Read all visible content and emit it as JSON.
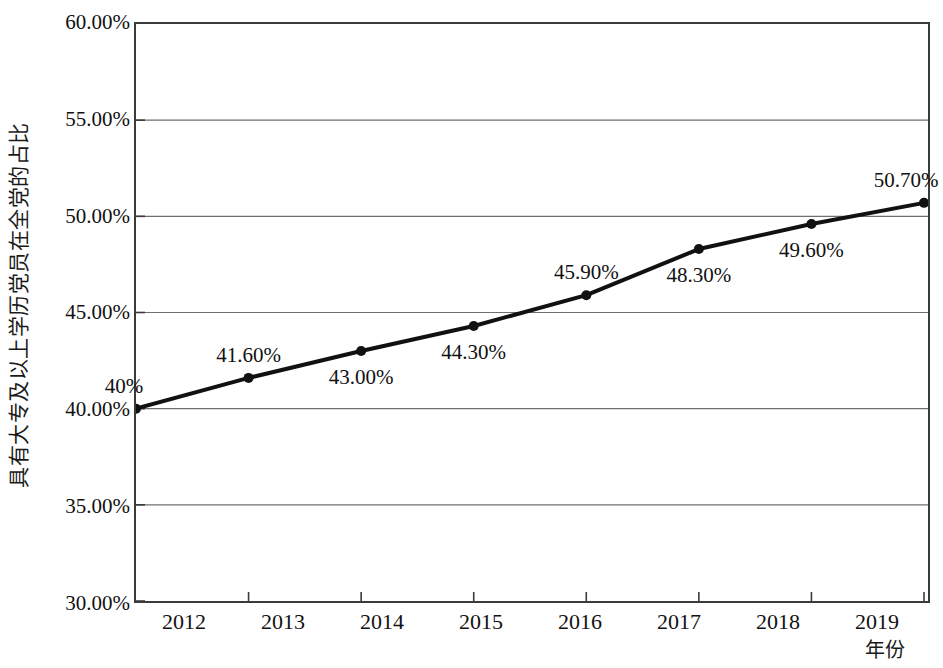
{
  "chart_data": {
    "type": "line",
    "title": "",
    "subtitle": "",
    "xlabel": "年份",
    "ylabel": "具有大专及以上学历党员在全党的占比",
    "x": [
      "2012",
      "2013",
      "2014",
      "2015",
      "2016",
      "2017",
      "2018",
      "2019"
    ],
    "categories": [
      "2012",
      "2013",
      "2014",
      "2015",
      "2016",
      "2017",
      "2018",
      "2019"
    ],
    "values": [
      40.0,
      41.6,
      43.0,
      44.3,
      45.9,
      48.3,
      49.6,
      50.7
    ],
    "point_labels": [
      "40%",
      "41.60%",
      "43.00%",
      "44.30%",
      "45.90%",
      "48.30%",
      "49.60%",
      "50.70%"
    ],
    "label_positions": [
      "above",
      "above",
      "below",
      "below",
      "above",
      "below",
      "below",
      "above"
    ],
    "ylim": [
      30.0,
      60.0
    ],
    "ytick_values": [
      60.0,
      55.0,
      50.0,
      45.0,
      40.0,
      35.0,
      30.0
    ],
    "ytick_labels": [
      "60.00%",
      "55.00%",
      "50.00%",
      "45.00%",
      "40.00%",
      "35.00%",
      "30.00%"
    ],
    "xtick_labels": [
      "2012",
      "2013",
      "2014",
      "2015",
      "2016",
      "2017",
      "2018",
      "2019"
    ],
    "grid": "horizontal",
    "legend": "none",
    "series": [
      {
        "name": "具有大专及以上学历党员在全党的占比",
        "values": [
          40.0,
          41.6,
          43.0,
          44.3,
          45.9,
          48.3,
          49.6,
          50.7
        ]
      }
    ],
    "colors": {
      "line": "#111111",
      "marker": "#111111",
      "grid": "#6f6f6f",
      "frame": "#3b3b3b",
      "text": "#111111",
      "background": "#ffffff"
    },
    "style": {
      "line_width_px": 4,
      "marker_radius_px": 5,
      "marker_shape": "circle"
    }
  }
}
